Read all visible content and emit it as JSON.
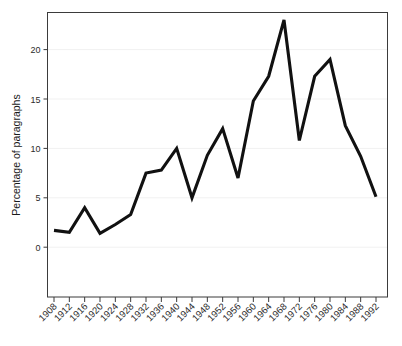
{
  "figure": {
    "background_color": "#ffffff",
    "line_color": "#111111",
    "frame_color": "#3b3b3b",
    "grid_color": "#f1f1f1"
  },
  "chart_data": {
    "type": "line",
    "title": "",
    "subtitle": "",
    "xlabel": "",
    "ylabel": "Percentage of paragraphs",
    "categories": [
      "1908",
      "1912",
      "1916",
      "1920",
      "1924",
      "1928",
      "1932",
      "1936",
      "1940",
      "1944",
      "1948",
      "1952",
      "1956",
      "1960",
      "1964",
      "1968",
      "1972",
      "1976",
      "1980",
      "1984",
      "1988",
      "1992"
    ],
    "x": [
      1908,
      1912,
      1916,
      1920,
      1924,
      1928,
      1932,
      1936,
      1940,
      1944,
      1948,
      1952,
      1956,
      1960,
      1964,
      1968,
      1972,
      1976,
      1980,
      1984,
      1988,
      1992
    ],
    "values": [
      1.7,
      1.5,
      4.0,
      1.4,
      2.3,
      3.3,
      7.5,
      7.8,
      10.0,
      5.0,
      9.3,
      12.0,
      7.0,
      14.8,
      17.3,
      23.0,
      10.8,
      17.3,
      19.0,
      12.3,
      9.2,
      5.1
    ],
    "series": [
      {
        "name": "Percentage of paragraphs",
        "values": [
          1.7,
          1.5,
          4.0,
          1.4,
          2.3,
          3.3,
          7.5,
          7.8,
          10.0,
          5.0,
          9.3,
          12.0,
          7.0,
          14.8,
          17.3,
          23.0,
          10.8,
          17.3,
          19.0,
          12.3,
          9.2,
          5.1
        ]
      }
    ],
    "ylim": [
      0,
      23.8
    ],
    "xlim": [
      1908,
      1992
    ],
    "yticks": [
      0,
      5,
      10,
      15,
      20
    ],
    "ytick_labels": [
      "0",
      "5",
      "10",
      "15",
      "20"
    ],
    "xtick_labels": [
      "1908",
      "1912",
      "1916",
      "1920",
      "1924",
      "1928",
      "1932",
      "1936",
      "1940",
      "1944",
      "1948",
      "1952",
      "1956",
      "1960",
      "1964",
      "1968",
      "1972",
      "1976",
      "1980",
      "1984",
      "1988",
      "1992"
    ],
    "xtick_rotation": -45,
    "grid": true,
    "grid_axis": "y",
    "legend": false,
    "legend_position": "none",
    "annotations": []
  }
}
